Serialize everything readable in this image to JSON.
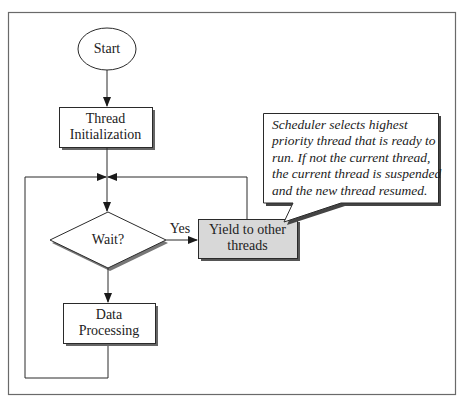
{
  "diagram": {
    "type": "flowchart",
    "nodes": {
      "start": {
        "shape": "ellipse",
        "label": "Start"
      },
      "thread_init": {
        "shape": "rectangle",
        "label_line1": "Thread",
        "label_line2": "Initialization"
      },
      "wait": {
        "shape": "diamond",
        "label": "Wait?"
      },
      "yield": {
        "shape": "rectangle",
        "label_line1": "Yield to other",
        "label_line2": "threads",
        "fill": "#d8d8d8"
      },
      "data_processing": {
        "shape": "rectangle",
        "label_line1": "Data",
        "label_line2": "Processing"
      }
    },
    "edges": {
      "wait_to_yield_label": "Yes"
    },
    "callout": {
      "lines": [
        "Scheduler selects highest",
        "priority thread that is ready to",
        "run. If not the current thread,",
        "the current thread is suspended",
        "and the new thread resumed."
      ]
    },
    "colors": {
      "stroke": "#2a2a2a",
      "shadow": "#555555",
      "frame": "#6a6a6a",
      "yield_fill": "#d8d8d8",
      "background": "#ffffff"
    }
  }
}
